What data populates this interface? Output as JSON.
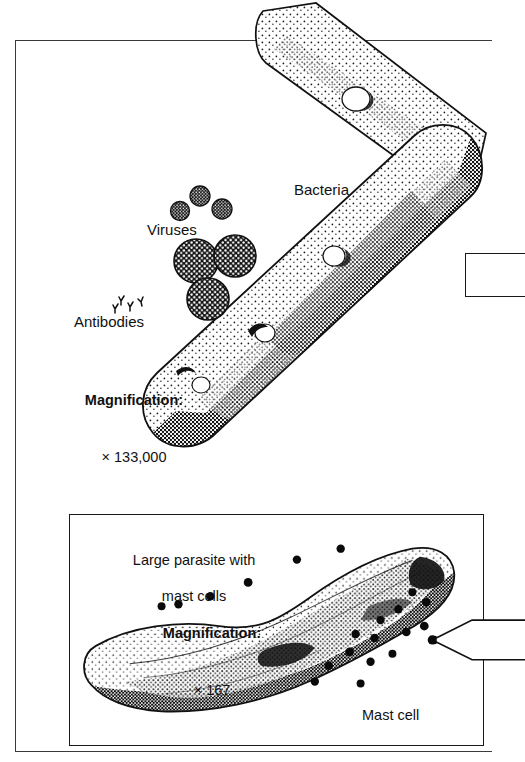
{
  "figure": {
    "background_color": "#ffffff",
    "ink_color": "#111111",
    "frame_color": "#3a3a3a"
  },
  "upper_panel": {
    "name": "bacteria-and-viruses-panel",
    "labels": {
      "bacteria": "Bacteria",
      "viruses": "Viruses",
      "antibodies": "Antibodies"
    },
    "magnification": {
      "word": "Magnification:",
      "value": "× 133,000"
    },
    "callout": {
      "shape": "rectangle",
      "cropped": "true"
    }
  },
  "lower_panel": {
    "name": "large-parasite-panel",
    "caption_line1": "Large parasite with",
    "caption_line2": "mast cells",
    "magnification": {
      "word": "Magnification:",
      "value": "× 167"
    },
    "mast_cell_label": "Mast cell",
    "callout": {
      "shape": "arrow-pointer",
      "cropped": "true"
    }
  }
}
